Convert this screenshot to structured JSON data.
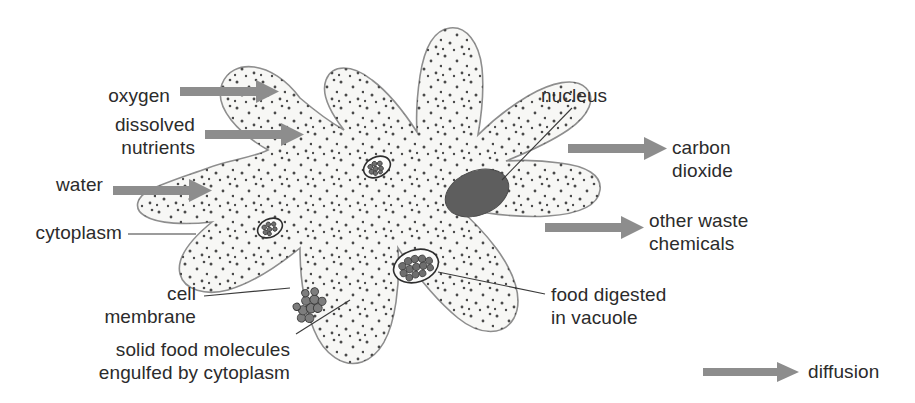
{
  "diagram": {
    "organism": "amoeba",
    "colors": {
      "cytoplasm_fill": "#f7f7f5",
      "membrane_stroke": "#8e8e8e",
      "nucleus_fill": "#5e5e5e",
      "arrow_gray": "#8d8d8d",
      "text": "#2b2b2b",
      "background": "#ffffff"
    }
  },
  "labels": {
    "oxygen": "oxygen",
    "dissolved_nutrients_line1": "dissolved",
    "dissolved_nutrients_line2": "nutrients",
    "water": "water",
    "cytoplasm": "cytoplasm",
    "cell_membrane_line1": "cell",
    "cell_membrane_line2": "membrane",
    "solid_food_line1": "solid food molecules",
    "solid_food_line2": "engulfed by cytoplasm",
    "nucleus": "nucleus",
    "carbon_dioxide_line1": "carbon",
    "carbon_dioxide_line2": "dioxide",
    "other_waste_line1": "other waste",
    "other_waste_line2": "chemicals",
    "food_digested_line1": "food digested",
    "food_digested_line2": "in vacuole"
  },
  "legend": {
    "diffusion": "diffusion",
    "symbol": "arrow-icon"
  },
  "flows": {
    "inward": [
      "oxygen",
      "dissolved nutrients",
      "water"
    ],
    "outward": [
      "carbon dioxide",
      "other waste chemicals"
    ]
  },
  "structures": [
    {
      "name": "nucleus",
      "kind": "organelle"
    },
    {
      "name": "cytoplasm",
      "kind": "region"
    },
    {
      "name": "cell membrane",
      "kind": "boundary"
    },
    {
      "name": "food vacuole",
      "kind": "organelle"
    },
    {
      "name": "solid food molecules",
      "kind": "particles"
    }
  ]
}
